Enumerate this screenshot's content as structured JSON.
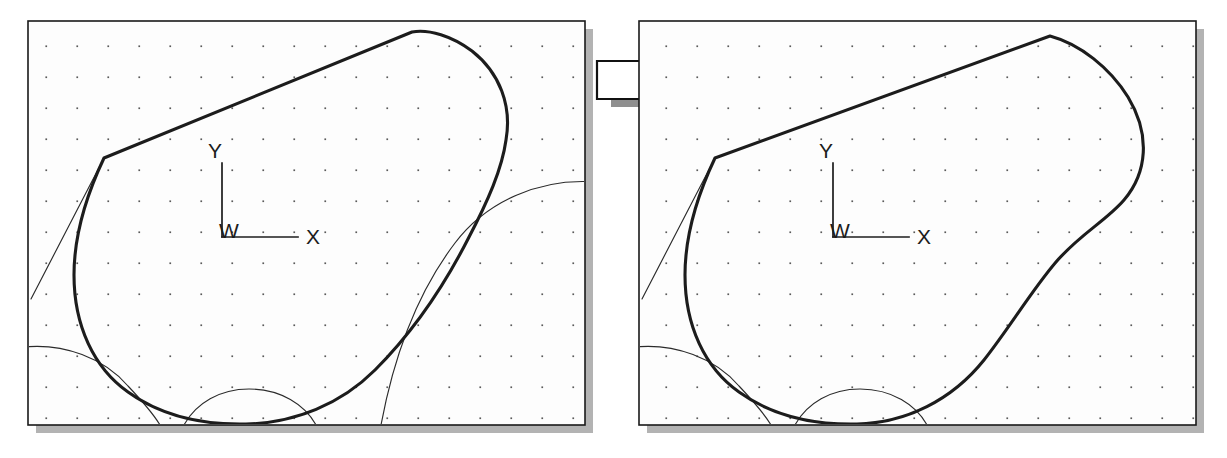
{
  "figure": {
    "kind": "before-after-geometry-diagram",
    "background_color": "#ffffff",
    "panel_fill_color": "#fdfdfd",
    "panel_border_color": "#1a1a1a",
    "shadow_color": "#b3b3b3",
    "bold_curve_color": "#1c1c1c",
    "thin_curve_color": "#2b2b2b",
    "grid_dot_color": "#5a5a5a",
    "grid_dot_spacing_px": 31
  },
  "panels": [
    {
      "id": "before",
      "name": "left-panel",
      "x": 28,
      "y": 21,
      "width": 557,
      "height": 404,
      "axis_triad": {
        "origin_label": "W",
        "x_label": "X",
        "y_label": "Y",
        "origin_x": 222,
        "origin_y": 237,
        "x_axis_length": 76,
        "y_axis_length": 74
      },
      "bold_boundary_note": "closed offset boundary with pointed upper-left tangent line and rounded right lobe",
      "thin_arcs_count": 3
    },
    {
      "id": "after",
      "name": "right-panel",
      "x": 639,
      "y": 21,
      "width": 557,
      "height": 404,
      "axis_triad": {
        "origin_label": "W",
        "x_label": "X",
        "y_label": "Y",
        "origin_x": 833,
        "origin_y": 237,
        "x_axis_length": 76,
        "y_axis_length": 74
      },
      "bold_boundary_note": "same boundary after the large lower-right circular trim has been absorbed into a smooth concave fillet",
      "thin_arcs_count": 2
    }
  ],
  "arrow": {
    "name": "transform-arrow",
    "direction": "right",
    "x": 597,
    "y": 48,
    "width": 96,
    "height": 58,
    "fill_color": "#ffffff",
    "outline_color": "#111111",
    "shadow_color": "#8f8f8f"
  },
  "labels": {
    "origin": "W",
    "x_axis": "X",
    "y_axis": "Y"
  }
}
